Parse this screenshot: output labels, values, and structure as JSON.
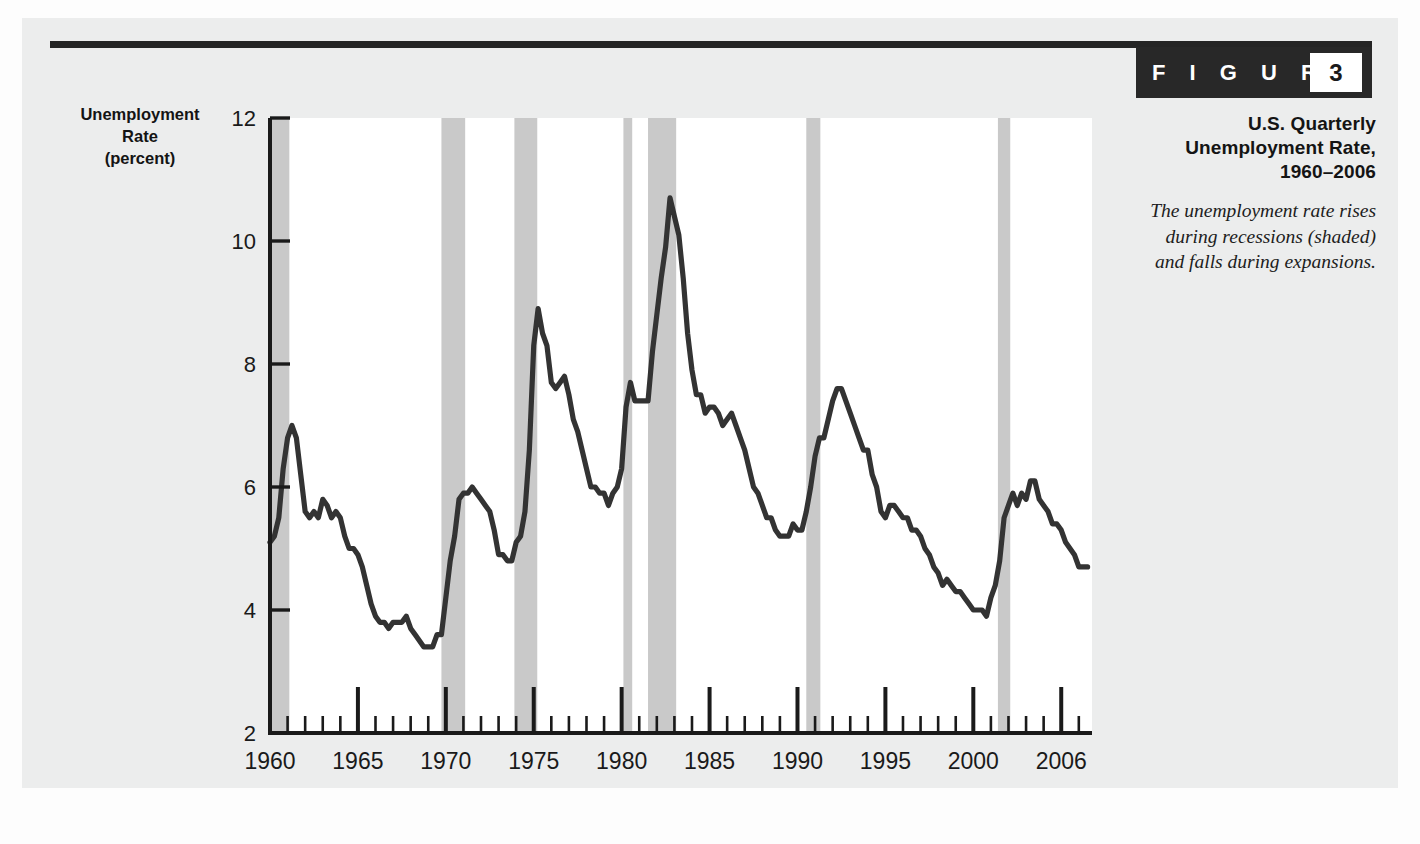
{
  "figure": {
    "badge_word": "F I G U R E",
    "badge_number": "3",
    "title": "U.S. Quarterly Unemployment Rate, 1960–2006",
    "caption": "The unemployment rate rises during recessions (shaded) and falls during expansions."
  },
  "axis_title": {
    "line1": "Unemployment",
    "line2": "Rate",
    "line3": "(percent)"
  },
  "colors": {
    "line": "#333333",
    "recession_band": "#c9c9c9",
    "axis": "#1a1a1a",
    "plot_background": "#ffffff",
    "panel_background": "#eceded",
    "badge_background": "#282828"
  },
  "chart_data": {
    "type": "line",
    "title": "U.S. Quarterly Unemployment Rate, 1960–2006",
    "xlabel": "",
    "ylabel": "Unemployment Rate (percent)",
    "xlim": [
      1960,
      2006.75
    ],
    "ylim": [
      2,
      12
    ],
    "grid": false,
    "legend": "none",
    "y_ticks": [
      2,
      4,
      6,
      8,
      10,
      12
    ],
    "y_tick_labels": [
      "2",
      "4",
      "6",
      "8",
      "10",
      "12"
    ],
    "x_ticks": [
      1960,
      1965,
      1970,
      1975,
      1980,
      1985,
      1990,
      1995,
      2000,
      2005
    ],
    "x_tick_labels": [
      "1960",
      "1965",
      "1970",
      "1975",
      "1980",
      "1985",
      "1990",
      "1995",
      "2000",
      "2006"
    ],
    "x_minor_tick_interval": 1,
    "series": [
      {
        "name": "Unemployment rate (percent)",
        "x": [
          1960.0,
          1960.25,
          1960.5,
          1960.75,
          1961.0,
          1961.25,
          1961.5,
          1961.75,
          1962.0,
          1962.25,
          1962.5,
          1962.75,
          1963.0,
          1963.25,
          1963.5,
          1963.75,
          1964.0,
          1964.25,
          1964.5,
          1964.75,
          1965.0,
          1965.25,
          1965.5,
          1965.75,
          1966.0,
          1966.25,
          1966.5,
          1966.75,
          1967.0,
          1967.25,
          1967.5,
          1967.75,
          1968.0,
          1968.25,
          1968.5,
          1968.75,
          1969.0,
          1969.25,
          1969.5,
          1969.75,
          1970.0,
          1970.25,
          1970.5,
          1970.75,
          1971.0,
          1971.25,
          1971.5,
          1971.75,
          1972.0,
          1972.25,
          1972.5,
          1972.75,
          1973.0,
          1973.25,
          1973.5,
          1973.75,
          1974.0,
          1974.25,
          1974.5,
          1974.75,
          1975.0,
          1975.25,
          1975.5,
          1975.75,
          1976.0,
          1976.25,
          1976.5,
          1976.75,
          1977.0,
          1977.25,
          1977.5,
          1977.75,
          1978.0,
          1978.25,
          1978.5,
          1978.75,
          1979.0,
          1979.25,
          1979.5,
          1979.75,
          1980.0,
          1980.25,
          1980.5,
          1980.75,
          1981.0,
          1981.25,
          1981.5,
          1981.75,
          1982.0,
          1982.25,
          1982.5,
          1982.75,
          1983.0,
          1983.25,
          1983.5,
          1983.75,
          1984.0,
          1984.25,
          1984.5,
          1984.75,
          1985.0,
          1985.25,
          1985.5,
          1985.75,
          1986.0,
          1986.25,
          1986.5,
          1986.75,
          1987.0,
          1987.25,
          1987.5,
          1987.75,
          1988.0,
          1988.25,
          1988.5,
          1988.75,
          1989.0,
          1989.25,
          1989.5,
          1989.75,
          1990.0,
          1990.25,
          1990.5,
          1990.75,
          1991.0,
          1991.25,
          1991.5,
          1991.75,
          1992.0,
          1992.25,
          1992.5,
          1992.75,
          1993.0,
          1993.25,
          1993.5,
          1993.75,
          1994.0,
          1994.25,
          1994.5,
          1994.75,
          1995.0,
          1995.25,
          1995.5,
          1995.75,
          1996.0,
          1996.25,
          1996.5,
          1996.75,
          1997.0,
          1997.25,
          1997.5,
          1997.75,
          1998.0,
          1998.25,
          1998.5,
          1998.75,
          1999.0,
          1999.25,
          1999.5,
          1999.75,
          2000.0,
          2000.25,
          2000.5,
          2000.75,
          2001.0,
          2001.25,
          2001.5,
          2001.75,
          2002.0,
          2002.25,
          2002.5,
          2002.75,
          2003.0,
          2003.25,
          2003.5,
          2003.75,
          2004.0,
          2004.25,
          2004.5,
          2004.75,
          2005.0,
          2005.25,
          2005.5,
          2005.75,
          2006.0,
          2006.25,
          2006.5
        ],
        "y": [
          5.1,
          5.2,
          5.5,
          6.3,
          6.8,
          7.0,
          6.8,
          6.2,
          5.6,
          5.5,
          5.6,
          5.5,
          5.8,
          5.7,
          5.5,
          5.6,
          5.5,
          5.2,
          5.0,
          5.0,
          4.9,
          4.7,
          4.4,
          4.1,
          3.9,
          3.8,
          3.8,
          3.7,
          3.8,
          3.8,
          3.8,
          3.9,
          3.7,
          3.6,
          3.5,
          3.4,
          3.4,
          3.4,
          3.6,
          3.6,
          4.2,
          4.8,
          5.2,
          5.8,
          5.9,
          5.9,
          6.0,
          5.9,
          5.8,
          5.7,
          5.6,
          5.3,
          4.9,
          4.9,
          4.8,
          4.8,
          5.1,
          5.2,
          5.6,
          6.6,
          8.3,
          8.9,
          8.5,
          8.3,
          7.7,
          7.6,
          7.7,
          7.8,
          7.5,
          7.1,
          6.9,
          6.6,
          6.3,
          6.0,
          6.0,
          5.9,
          5.9,
          5.7,
          5.9,
          6.0,
          6.3,
          7.3,
          7.7,
          7.4,
          7.4,
          7.4,
          7.4,
          8.2,
          8.8,
          9.4,
          9.9,
          10.7,
          10.4,
          10.1,
          9.4,
          8.5,
          7.9,
          7.5,
          7.5,
          7.2,
          7.3,
          7.3,
          7.2,
          7.0,
          7.1,
          7.2,
          7.0,
          6.8,
          6.6,
          6.3,
          6.0,
          5.9,
          5.7,
          5.5,
          5.5,
          5.3,
          5.2,
          5.2,
          5.2,
          5.4,
          5.3,
          5.3,
          5.6,
          6.0,
          6.5,
          6.8,
          6.8,
          7.1,
          7.4,
          7.6,
          7.6,
          7.4,
          7.2,
          7.0,
          6.8,
          6.6,
          6.6,
          6.2,
          6.0,
          5.6,
          5.5,
          5.7,
          5.7,
          5.6,
          5.5,
          5.5,
          5.3,
          5.3,
          5.2,
          5.0,
          4.9,
          4.7,
          4.6,
          4.4,
          4.5,
          4.4,
          4.3,
          4.3,
          4.2,
          4.1,
          4.0,
          4.0,
          4.0,
          3.9,
          4.2,
          4.4,
          4.8,
          5.5,
          5.7,
          5.9,
          5.7,
          5.9,
          5.8,
          6.1,
          6.1,
          5.8,
          5.7,
          5.6,
          5.4,
          5.4,
          5.3,
          5.1,
          5.0,
          4.9,
          4.7,
          4.7,
          4.7
        ]
      }
    ],
    "recession_bands": [
      {
        "label": "1960–61 recession",
        "start": 1960.0,
        "end": 1961.1
      },
      {
        "label": "1969–70 recession",
        "start": 1969.75,
        "end": 1971.1
      },
      {
        "label": "1973–75 recession",
        "start": 1973.9,
        "end": 1975.2
      },
      {
        "label": "1980 recession",
        "start": 1980.1,
        "end": 1980.6
      },
      {
        "label": "1981–82 recession",
        "start": 1981.5,
        "end": 1983.1
      },
      {
        "label": "1990–91 recession",
        "start": 1990.5,
        "end": 1991.3
      },
      {
        "label": "2001 recession",
        "start": 2001.4,
        "end": 2002.1
      }
    ]
  }
}
